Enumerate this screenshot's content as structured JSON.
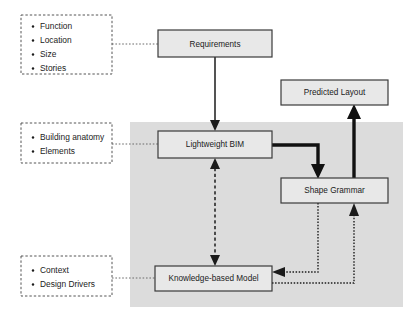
{
  "diagram": {
    "shaded_region_label": "computational-core-region",
    "colors": {
      "box_fill": "#e8e8e8",
      "box_stroke": "#3a3a3a",
      "shaded_region": "#dcdcdc",
      "arrow": "#1b1b1b",
      "dashed_box_stroke": "#555555",
      "page_background": "#ffffff"
    },
    "boxes": [
      {
        "id": "requirements",
        "label": "Requirements",
        "x": 158,
        "y": 30,
        "w": 114,
        "h": 27
      },
      {
        "id": "predicted",
        "label": "Predicted Layout",
        "x": 281,
        "y": 80,
        "w": 107,
        "h": 25
      },
      {
        "id": "lightweight",
        "label": "Lightweight BIM",
        "x": 158,
        "y": 131,
        "w": 114,
        "h": 27
      },
      {
        "id": "shape_grammar",
        "label": "Shape Grammar",
        "x": 281,
        "y": 178,
        "w": 107,
        "h": 25
      },
      {
        "id": "knowledge",
        "label": "Knowledge-based Model",
        "x": 155,
        "y": 266,
        "w": 117,
        "h": 25
      }
    ],
    "note_boxes": [
      {
        "id": "note-requirements",
        "x": 21,
        "y": 15,
        "w": 91,
        "h": 59,
        "items": [
          "Function",
          "Location",
          "Size",
          "Stories"
        ]
      },
      {
        "id": "note-lightweight",
        "x": 21,
        "y": 123,
        "w": 91,
        "h": 40,
        "items": [
          "Building anatomy",
          "Elements"
        ]
      },
      {
        "id": "note-knowledge",
        "x": 21,
        "y": 256,
        "w": 91,
        "h": 40,
        "items": [
          "Context",
          "Design Drivers"
        ]
      }
    ],
    "shaded_region": {
      "x": 130,
      "y": 122,
      "w": 273,
      "h": 185
    },
    "connectors": [
      {
        "id": "requirements-to-lightweight",
        "style": "solid-thin",
        "direction": "down"
      },
      {
        "id": "lightweight-to-shape-grammar",
        "style": "solid-thick",
        "direction": "down-right"
      },
      {
        "id": "shape-grammar-to-predicted-layout",
        "style": "solid-thick",
        "direction": "up"
      },
      {
        "id": "lightweight-knowledge-bidirectional",
        "style": "dashed",
        "direction": "both"
      },
      {
        "id": "shape-grammar-to-knowledge",
        "style": "dotted",
        "direction": "left"
      },
      {
        "id": "knowledge-to-shape-grammar",
        "style": "dotted",
        "direction": "up"
      },
      {
        "id": "note-to-requirements",
        "style": "connector-dotted",
        "direction": "right"
      },
      {
        "id": "note-to-lightweight",
        "style": "connector-dotted",
        "direction": "right"
      },
      {
        "id": "note-to-knowledge",
        "style": "connector-dotted",
        "direction": "right"
      }
    ]
  }
}
